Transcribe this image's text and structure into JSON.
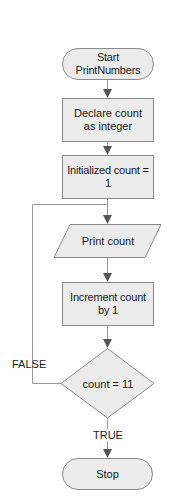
{
  "diagram": {
    "type": "flowchart",
    "colors": {
      "node_fill": "#ececec",
      "node_stroke": "#8a8a8a",
      "edge_stroke": "#9a9a9a",
      "arrow_fill": "#555555",
      "text": "#1a1a1a"
    },
    "nodes": [
      {
        "id": "start",
        "shape": "terminator",
        "label": "Start PrintNumbers"
      },
      {
        "id": "declare",
        "shape": "process",
        "label": "Declare count as integer"
      },
      {
        "id": "init",
        "shape": "process",
        "label": "Initialized count = 1"
      },
      {
        "id": "print",
        "shape": "io",
        "label": "Print count"
      },
      {
        "id": "increment",
        "shape": "process",
        "label": "Increment count by 1"
      },
      {
        "id": "decision",
        "shape": "decision",
        "label": "count = 11"
      },
      {
        "id": "stop",
        "shape": "terminator",
        "label": "Stop"
      }
    ],
    "edges": [
      {
        "from": "start",
        "to": "declare",
        "label": ""
      },
      {
        "from": "declare",
        "to": "init",
        "label": ""
      },
      {
        "from": "init",
        "to": "print",
        "label": ""
      },
      {
        "from": "print",
        "to": "increment",
        "label": ""
      },
      {
        "from": "increment",
        "to": "decision",
        "label": ""
      },
      {
        "from": "decision",
        "to": "print",
        "label": "FALSE"
      },
      {
        "from": "decision",
        "to": "stop",
        "label": "TRUE"
      }
    ],
    "edge_labels": {
      "false": "FALSE",
      "true": "TRUE"
    }
  }
}
